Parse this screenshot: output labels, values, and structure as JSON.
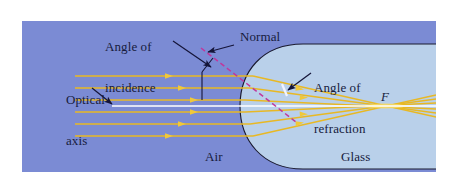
{
  "figure": {
    "domain": "diagram",
    "title_visible": false,
    "width": 459,
    "height": 193
  },
  "colors": {
    "page_background": "#ffffff",
    "air_region": "#7b8bd4",
    "glass_region": "#b9d0ea",
    "ray": "#e8b824",
    "ray_light": "#f0d070",
    "optical_axis": "#ffffff",
    "normal_dashed": "#c0389c",
    "outline": "#1a1a2e",
    "label_text": "#171b3d",
    "leader_arrow": "#141438"
  },
  "labels": {
    "angle_of_incidence": "Angle of\nincidence",
    "angle_of_incidence_line1": "Angle of",
    "angle_of_incidence_line2": "incidence",
    "normal": "Normal",
    "angle_of_refraction_line1": "Angle of",
    "angle_of_refraction_line2": "refraction",
    "optical_axis_line1": "Optical",
    "optical_axis_line2": "axis",
    "air": "Air",
    "glass": "Glass",
    "focal_point": "F"
  },
  "regions": [
    {
      "name": "air",
      "label": "Air",
      "fill": "#7b8bd4"
    },
    {
      "name": "glass",
      "label": "Glass",
      "fill": "#b9d0ea"
    }
  ],
  "optics": {
    "axis_y": 106,
    "focal_point_x": 385,
    "focal_point_y": 106,
    "incident_ray_count": 6,
    "incident_ray_y": [
      76,
      88,
      100,
      112,
      124,
      136
    ],
    "incident_ray_start_x": 75,
    "surface_vertex_x": 256,
    "surface_center_y": 106,
    "arrow_marker": "filled-triangle",
    "normal_line_style": "dashed",
    "normal_angle_deg": 20
  },
  "annotations": [
    {
      "name": "angle-of-incidence",
      "text": "Angle of incidence",
      "points_to": "incident ray / normal vertex"
    },
    {
      "name": "normal",
      "text": "Normal",
      "points_to": "dashed normal line"
    },
    {
      "name": "angle-of-refraction",
      "text": "Angle of refraction",
      "points_to": "refracted ray / normal inside glass"
    },
    {
      "name": "optical-axis",
      "text": "Optical axis",
      "points_to": "white horizontal axis line"
    }
  ]
}
